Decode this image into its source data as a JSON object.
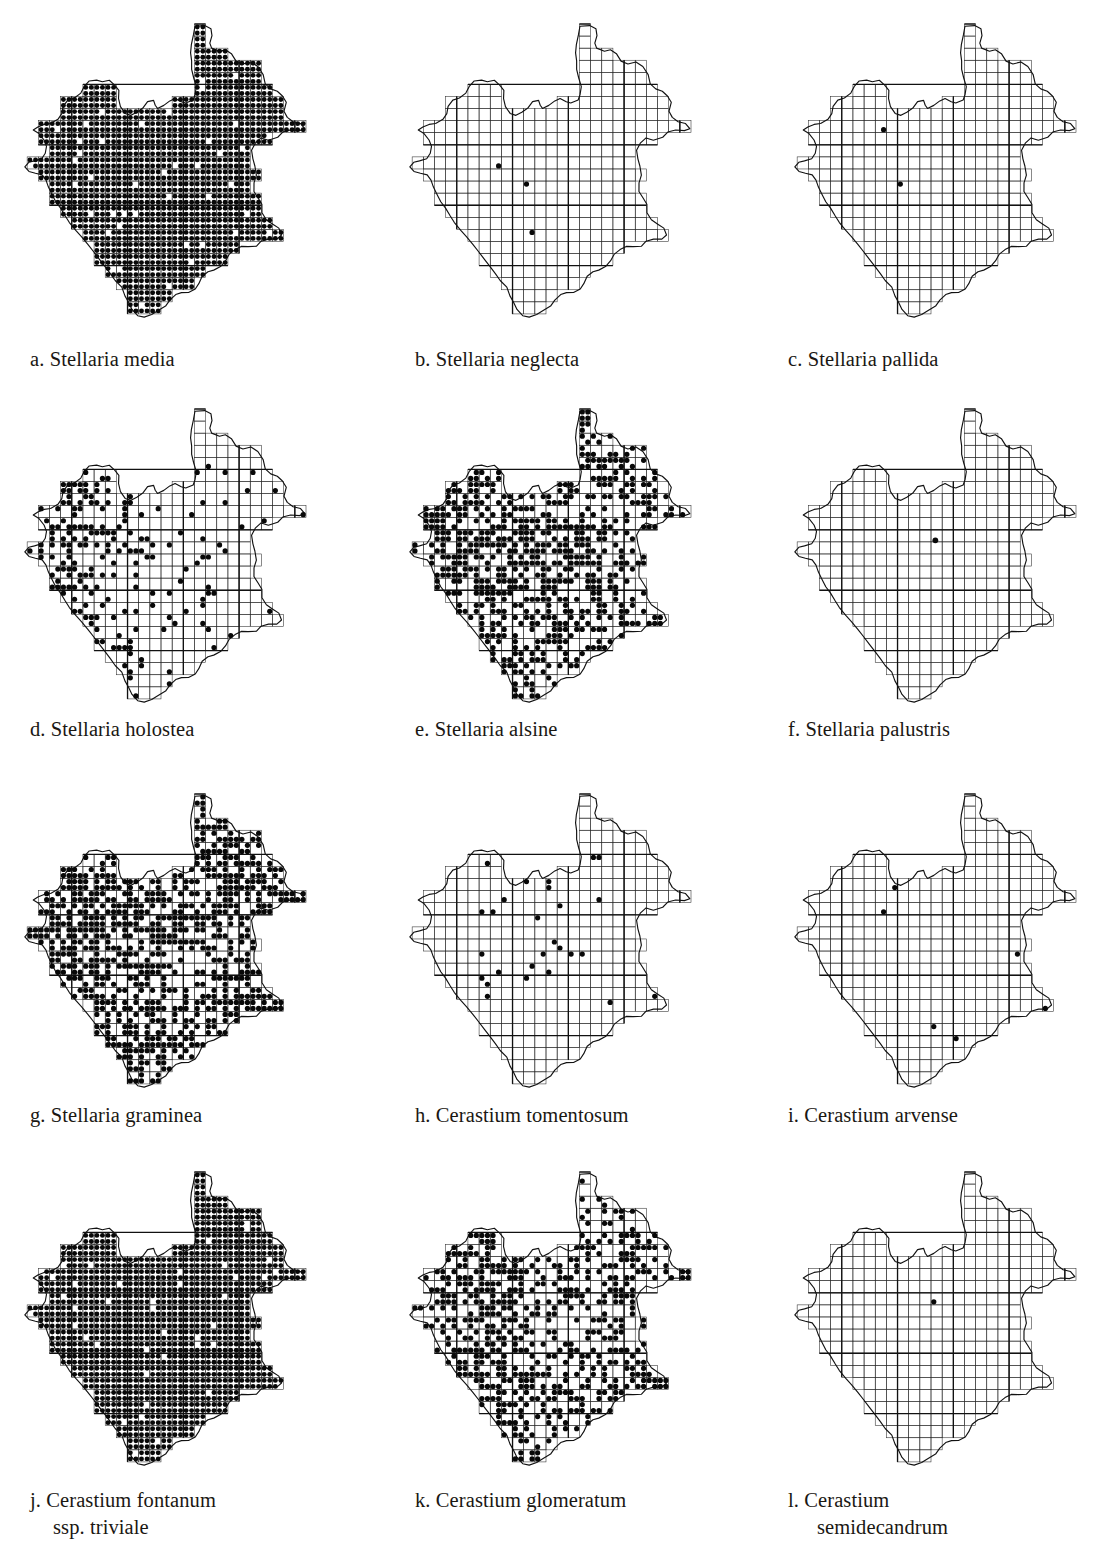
{
  "page": {
    "kind": "botanical-atlas-distribution-maps",
    "running_head_left": "",
    "running_head_right": "",
    "columns": 3,
    "rows": 4
  },
  "legend": {
    "dot_meaning": "record present in tetrad",
    "grid_meaning": "tetrad grid over vice-county outline"
  },
  "maps": [
    {
      "key": "a",
      "label_prefix": "a.",
      "taxon": "Stellaria media",
      "caption_line_1": "a. Stellaria media",
      "caption_line_2": "",
      "density": 0.97,
      "pattern": "near-universal"
    },
    {
      "key": "b",
      "label_prefix": "b.",
      "taxon": "Stellaria neglecta",
      "caption_line_1": "b. Stellaria neglecta",
      "caption_line_2": "",
      "density": 0.012,
      "pattern": "very-rare-central"
    },
    {
      "key": "c",
      "label_prefix": "c.",
      "taxon": "Stellaria pallida",
      "caption_line_1": "c. Stellaria pallida",
      "caption_line_2": "",
      "density": 0.012,
      "pattern": "very-rare-central-southeast"
    },
    {
      "key": "d",
      "label_prefix": "d.",
      "taxon": "Stellaria holostea",
      "caption_line_1": "d. Stellaria holostea",
      "caption_line_2": "",
      "density": 0.3,
      "pattern": "western-concentration"
    },
    {
      "key": "e",
      "label_prefix": "e.",
      "taxon": "Stellaria alsine",
      "caption_line_1": "e. Stellaria alsine",
      "caption_line_2": "",
      "density": 0.46,
      "pattern": "widespread-west-and-north"
    },
    {
      "key": "f",
      "label_prefix": "f.",
      "taxon": "Stellaria palustris",
      "caption_line_1": "f. Stellaria palustris",
      "caption_line_2": "",
      "density": 0.002,
      "pattern": "single-record"
    },
    {
      "key": "g",
      "label_prefix": "g.",
      "taxon": "Stellaria graminea",
      "caption_line_1": "g. Stellaria graminea",
      "caption_line_2": "",
      "density": 0.62,
      "pattern": "widespread-gaps-centre-east"
    },
    {
      "key": "h",
      "label_prefix": "h.",
      "taxon": "Cerastium tomentosum",
      "caption_line_1": "h. Cerastium tomentosum",
      "caption_line_2": "",
      "density": 0.045,
      "pattern": "scattered-central"
    },
    {
      "key": "i",
      "label_prefix": "i.",
      "taxon": "Cerastium arvense",
      "caption_line_1": "i. Cerastium arvense",
      "caption_line_2": "",
      "density": 0.01,
      "pattern": "very-rare-scattered"
    },
    {
      "key": "j",
      "label_prefix": "j.",
      "taxon": "Cerastium fontanum ssp. triviale",
      "caption_line_1": "j. Cerastium fontanum",
      "caption_line_2": "ssp. triviale",
      "density": 0.96,
      "pattern": "near-universal"
    },
    {
      "key": "k",
      "label_prefix": "k.",
      "taxon": "Cerastium glomeratum",
      "caption_line_1": "k. Cerastium glomeratum",
      "caption_line_2": "",
      "density": 0.52,
      "pattern": "widespread-west-and-southeast"
    },
    {
      "key": "l",
      "label_prefix": "l.",
      "taxon": "Cerastium semidecandrum",
      "caption_line_1": "l. Cerastium",
      "caption_line_2": "semidecandrum",
      "density": 0.01,
      "pattern": "very-rare-central"
    }
  ],
  "chart_data": {
    "type": "scatter",
    "title": "",
    "xlabel": "",
    "ylabel": "",
    "note": "Twelve tetrad presence maps of one vice-county; each map plots filled dots in occupied tetrads of a 2 km grid.",
    "grid_cols": 26,
    "grid_rows": 25,
    "coarse_every": 5,
    "series": [
      {
        "name": "a. Stellaria media",
        "occupied_tetrads": 560,
        "fill_fraction": 0.97
      },
      {
        "name": "b. Stellaria neglecta",
        "occupied_tetrads": 12,
        "fill_fraction": 0.012
      },
      {
        "name": "c. Stellaria pallida",
        "occupied_tetrads": 12,
        "fill_fraction": 0.012
      },
      {
        "name": "d. Stellaria holostea",
        "occupied_tetrads": 175,
        "fill_fraction": 0.3
      },
      {
        "name": "e. Stellaria alsine",
        "occupied_tetrads": 268,
        "fill_fraction": 0.46
      },
      {
        "name": "f. Stellaria palustris",
        "occupied_tetrads": 1,
        "fill_fraction": 0.002
      },
      {
        "name": "g. Stellaria graminea",
        "occupied_tetrads": 360,
        "fill_fraction": 0.62
      },
      {
        "name": "h. Cerastium tomentosum",
        "occupied_tetrads": 41,
        "fill_fraction": 0.045
      },
      {
        "name": "i. Cerastium arvense",
        "occupied_tetrads": 9,
        "fill_fraction": 0.01
      },
      {
        "name": "j. Cerastium fontanum ssp. triviale",
        "occupied_tetrads": 556,
        "fill_fraction": 0.96
      },
      {
        "name": "k. Cerastium glomeratum",
        "occupied_tetrads": 302,
        "fill_fraction": 0.52
      },
      {
        "name": "l. Cerastium semidecandrum",
        "occupied_tetrads": 9,
        "fill_fraction": 0.01
      }
    ]
  }
}
